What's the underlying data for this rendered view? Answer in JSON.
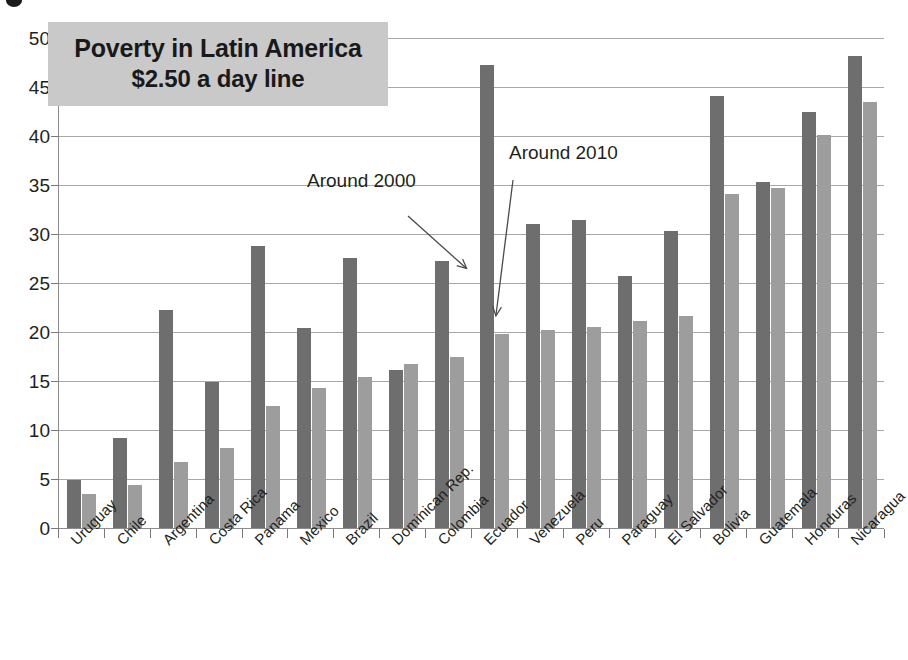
{
  "chart_data": {
    "type": "bar",
    "title": "Poverty in Latin America",
    "subtitle": "$2.50 a day line",
    "xlabel": "",
    "ylabel": "",
    "ylim": [
      0,
      50
    ],
    "ytick_step": 5,
    "yticks": [
      "50",
      "45",
      "40",
      "35",
      "30",
      "25",
      "20",
      "15",
      "10",
      "5",
      "0"
    ],
    "grid": true,
    "legend_position": "none",
    "categories": [
      "Uruguay",
      "Chile",
      "Argentina",
      "Costa Rica",
      "Panama",
      "Mexico",
      "Brazil",
      "Dominican Rep.",
      "Colombia",
      "Ecuador",
      "Venezuela",
      "Peru",
      "Paraguay",
      "El Salvador",
      "Bolivia",
      "Guatemala",
      "Honduras",
      "Nicaragua"
    ],
    "series": [
      {
        "name": "Around 2000",
        "color": "#6e6e6e",
        "values": [
          4.9,
          9.2,
          22.2,
          14.9,
          28.8,
          20.4,
          27.6,
          16.1,
          27.2,
          47.2,
          31.0,
          31.4,
          25.7,
          30.3,
          44.1,
          35.3,
          42.5,
          48.2
        ]
      },
      {
        "name": "Around 2010",
        "color": "#9d9d9d",
        "values": [
          3.5,
          4.4,
          6.7,
          8.2,
          12.5,
          14.3,
          15.4,
          16.7,
          17.4,
          19.8,
          20.2,
          20.5,
          21.1,
          21.6,
          34.1,
          34.7,
          40.1,
          43.5
        ]
      }
    ],
    "annotations": [
      {
        "text": "Around 2000",
        "target": "Ecuador dark bar"
      },
      {
        "text": "Around 2010",
        "target": "Ecuador light bar"
      }
    ]
  }
}
